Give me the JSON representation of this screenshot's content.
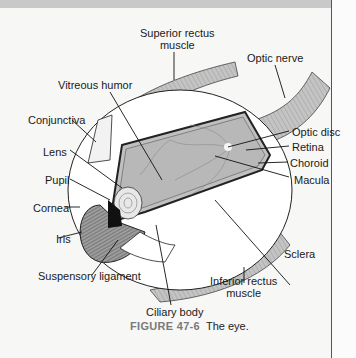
{
  "figure": {
    "number_label": "FIGURE 47-6",
    "caption_text": "The eye.",
    "colors": {
      "top_bar": "#c9c9c9",
      "caption_label": "#7a7a7a",
      "vitreous": "#bdbdbd",
      "muscle": "#b5b5b5",
      "outline": "#222222"
    }
  },
  "labels": {
    "superior_rectus_line1": "Superior rectus",
    "superior_rectus_line2": "muscle",
    "optic_nerve": "Optic nerve",
    "vitreous_humor": "Vitreous humor",
    "conjunctiva": "Conjunctiva",
    "optic_disc": "Optic disc",
    "retina": "Retina",
    "lens": "Lens",
    "choroid": "Choroid",
    "pupil": "Pupil",
    "macula": "Macula",
    "cornea": "Cornea",
    "iris": "Iris",
    "sclera": "Sclera",
    "suspensory_ligament": "Suspensory ligament",
    "inferior_rectus_line1": "Inferior rectus",
    "inferior_rectus_line2": "muscle",
    "ciliary_body": "Ciliary body"
  }
}
